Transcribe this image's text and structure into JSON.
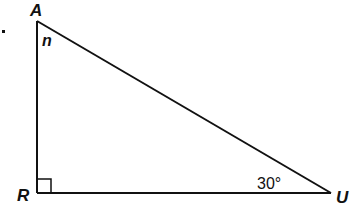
{
  "diagram": {
    "type": "right-triangle",
    "vertices": [
      {
        "id": "A",
        "label": "A",
        "x": 37,
        "y": 21
      },
      {
        "id": "R",
        "label": "R",
        "x": 37,
        "y": 193
      },
      {
        "id": "U",
        "label": "U",
        "x": 331,
        "y": 193
      }
    ],
    "angles": {
      "A": {
        "label": "n"
      },
      "R": {
        "label": "",
        "right_angle": true
      },
      "U": {
        "label": "30°"
      }
    },
    "stroke_color": "#111111",
    "background": "#ffffff"
  }
}
